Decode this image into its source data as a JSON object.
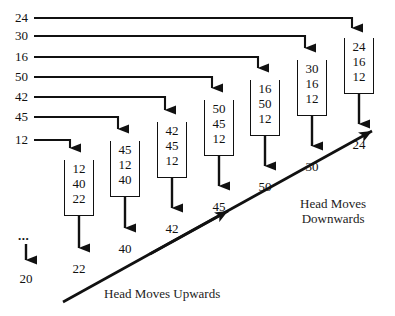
{
  "diagram": {
    "colors": {
      "ink": "#111111",
      "background": "#ffffff"
    },
    "request_labels": [
      {
        "value": "24",
        "y": 18,
        "line_end_x": 352
      },
      {
        "value": "30",
        "y": 36,
        "line_end_x": 305
      },
      {
        "value": "16",
        "y": 57,
        "line_end_x": 258
      },
      {
        "value": "50",
        "y": 77,
        "line_end_x": 212
      },
      {
        "value": "42",
        "y": 97,
        "line_end_x": 165
      },
      {
        "value": "45",
        "y": 117,
        "line_end_x": 118
      },
      {
        "value": "12",
        "y": 140,
        "line_end_x": 70
      }
    ],
    "queues": [
      {
        "id": "queue-1",
        "x": 64,
        "y": 160,
        "cells": [
          "12",
          "40",
          "22"
        ],
        "output": "22",
        "output_y": 262
      },
      {
        "id": "queue-2",
        "x": 110,
        "y": 141,
        "cells": [
          "45",
          "12",
          "40"
        ],
        "output": "40",
        "output_y": 242
      },
      {
        "id": "queue-3",
        "x": 157,
        "y": 122,
        "cells": [
          "42",
          "45",
          "12"
        ],
        "output": "42",
        "output_y": 222
      },
      {
        "id": "queue-4",
        "x": 204,
        "y": 100,
        "cells": [
          "50",
          "45",
          "12"
        ],
        "output": "45",
        "output_y": 200
      },
      {
        "id": "queue-5",
        "x": 250,
        "y": 80,
        "cells": [
          "16",
          "50",
          "12"
        ],
        "output": "50",
        "output_y": 180
      },
      {
        "id": "queue-6",
        "x": 297,
        "y": 60,
        "cells": [
          "30",
          "16",
          "12"
        ],
        "output": "30",
        "output_y": 160
      },
      {
        "id": "queue-7",
        "x": 344,
        "y": 38,
        "cells": [
          "24",
          "16",
          "12"
        ],
        "output": "24",
        "output_y": 138
      }
    ],
    "initial": {
      "ellipsis": "...",
      "value": "20"
    },
    "annotations": {
      "upwards": "Head Moves Upwards",
      "downwards": "Head Moves\nDownwards"
    }
  }
}
